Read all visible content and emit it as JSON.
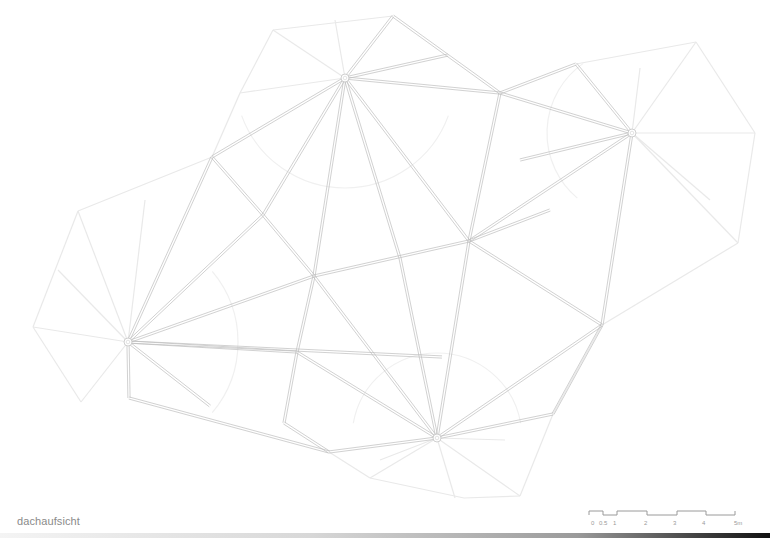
{
  "caption": "dachaufsicht",
  "scale_bar": {
    "labels": [
      "0",
      "0.5",
      "1",
      "2",
      "3",
      "4",
      "5m"
    ],
    "label_x": [
      2,
      10,
      24,
      55,
      84,
      113,
      145
    ]
  },
  "colors": {
    "primary_line": "#bdbdbd",
    "secondary_line": "#e9e9e9",
    "caption_text": "#8a8a8a"
  },
  "hubs": [
    {
      "name": "hub-top",
      "x": 345,
      "y": 78
    },
    {
      "name": "hub-right",
      "x": 632,
      "y": 133
    },
    {
      "name": "hub-left",
      "x": 128,
      "y": 342
    },
    {
      "name": "hub-bottom",
      "x": 437,
      "y": 438
    }
  ],
  "primary_edges": [
    [
      345,
      78,
      393,
      16
    ],
    [
      393,
      16,
      500,
      93
    ],
    [
      345,
      78,
      448,
      55
    ],
    [
      345,
      78,
      500,
      93
    ],
    [
      345,
      78,
      212,
      157
    ],
    [
      212,
      157,
      128,
      342
    ],
    [
      345,
      78,
      263,
      215
    ],
    [
      263,
      215,
      128,
      342
    ],
    [
      345,
      78,
      314,
      276
    ],
    [
      345,
      78,
      400,
      258
    ],
    [
      345,
      78,
      469,
      241
    ],
    [
      500,
      93,
      576,
      64
    ],
    [
      576,
      64,
      632,
      133
    ],
    [
      500,
      93,
      632,
      133
    ],
    [
      500,
      93,
      469,
      241
    ],
    [
      469,
      241,
      632,
      133
    ],
    [
      469,
      241,
      550,
      210
    ],
    [
      632,
      133,
      602,
      325
    ],
    [
      632,
      133,
      520,
      160
    ],
    [
      128,
      342,
      314,
      276
    ],
    [
      314,
      276,
      469,
      241
    ],
    [
      128,
      342,
      297,
      352
    ],
    [
      128,
      342,
      210,
      406
    ],
    [
      128,
      342,
      129,
      398
    ],
    [
      129,
      398,
      329,
      452
    ],
    [
      128,
      342,
      442,
      357
    ],
    [
      314,
      276,
      297,
      352
    ],
    [
      297,
      352,
      284,
      423
    ],
    [
      314,
      276,
      437,
      438
    ],
    [
      297,
      352,
      437,
      438
    ],
    [
      284,
      423,
      329,
      452
    ],
    [
      329,
      452,
      437,
      438
    ],
    [
      400,
      258,
      437,
      438
    ],
    [
      469,
      241,
      437,
      438
    ],
    [
      469,
      241,
      602,
      325
    ],
    [
      602,
      325,
      437,
      438
    ],
    [
      602,
      325,
      553,
      414
    ],
    [
      553,
      414,
      437,
      438
    ],
    [
      263,
      215,
      314,
      276
    ],
    [
      212,
      157,
      263,
      215
    ]
  ],
  "secondary_edges": [
    [
      345,
      78,
      273,
      30
    ],
    [
      273,
      30,
      393,
      16
    ],
    [
      273,
      30,
      240,
      93
    ],
    [
      240,
      93,
      212,
      157
    ],
    [
      345,
      78,
      240,
      93
    ],
    [
      345,
      78,
      335,
      20
    ],
    [
      632,
      133,
      696,
      42
    ],
    [
      696,
      42,
      576,
      64
    ],
    [
      696,
      42,
      755,
      133
    ],
    [
      755,
      133,
      632,
      133
    ],
    [
      755,
      133,
      738,
      243
    ],
    [
      738,
      243,
      632,
      133
    ],
    [
      738,
      243,
      602,
      325
    ],
    [
      632,
      133,
      640,
      68
    ],
    [
      632,
      133,
      710,
      200
    ],
    [
      128,
      342,
      78,
      211
    ],
    [
      78,
      211,
      212,
      157
    ],
    [
      78,
      211,
      33,
      327
    ],
    [
      33,
      327,
      128,
      342
    ],
    [
      33,
      327,
      81,
      402
    ],
    [
      81,
      402,
      128,
      342
    ],
    [
      128,
      342,
      145,
      200
    ],
    [
      128,
      342,
      58,
      270
    ],
    [
      437,
      438,
      370,
      478
    ],
    [
      370,
      478,
      464,
      498
    ],
    [
      464,
      498,
      520,
      496
    ],
    [
      520,
      496,
      437,
      438
    ],
    [
      520,
      496,
      553,
      414
    ],
    [
      437,
      438,
      455,
      498
    ],
    [
      437,
      438,
      505,
      440
    ],
    [
      437,
      438,
      380,
      460
    ],
    [
      553,
      414,
      602,
      325
    ],
    [
      370,
      478,
      329,
      452
    ]
  ],
  "arcs": [
    {
      "cx": 345,
      "cy": 78,
      "r": 110,
      "start": 20,
      "end": 160
    },
    {
      "cx": 632,
      "cy": 133,
      "r": 85,
      "start": 130,
      "end": 235
    },
    {
      "cx": 128,
      "cy": 342,
      "r": 110,
      "start": -40,
      "end": 40
    },
    {
      "cx": 437,
      "cy": 438,
      "r": 85,
      "start": 190,
      "end": 350
    }
  ]
}
